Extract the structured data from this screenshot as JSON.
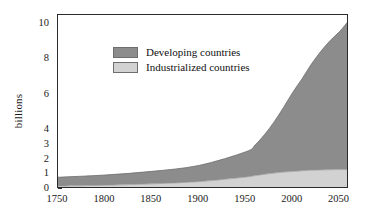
{
  "chart_data": {
    "type": "area",
    "stacked": true,
    "title": "",
    "xlabel": "",
    "ylabel": "billions",
    "xlim": [
      1750,
      2060
    ],
    "ylim": [
      0,
      10.5
    ],
    "grid": false,
    "legend_position": "inside-upper-left",
    "xticks": [
      1750,
      1800,
      1850,
      1900,
      1950,
      2000,
      2050
    ],
    "xtick_labels": [
      "1750",
      "1800",
      "1850",
      "1900",
      "1950",
      "2000",
      "2050"
    ],
    "yticks": [
      0,
      1,
      2,
      3,
      4,
      6,
      8,
      10
    ],
    "ytick_labels": [
      "0",
      "1",
      "2",
      "3",
      "4",
      "6",
      "8",
      "10"
    ],
    "x": [
      1750,
      1800,
      1850,
      1900,
      1950,
      1960,
      1970,
      1980,
      1990,
      2000,
      2010,
      2020,
      2030,
      2040,
      2050,
      2060
    ],
    "series": [
      {
        "name": "Industrialized countries",
        "color": "#d2d2d2",
        "values": [
          0.2,
          0.25,
          0.35,
          0.5,
          0.81,
          0.91,
          1.0,
          1.08,
          1.15,
          1.19,
          1.24,
          1.28,
          1.3,
          1.31,
          1.32,
          1.32
        ]
      },
      {
        "name": "Developing countries",
        "color": "#8c8c8c",
        "values": [
          0.6,
          0.7,
          0.85,
          1.1,
          1.72,
          2.09,
          2.7,
          3.37,
          4.11,
          4.94,
          5.66,
          6.45,
          7.15,
          7.75,
          8.25,
          8.88
        ]
      }
    ],
    "totals": [
      0.8,
      0.95,
      1.2,
      1.6,
      2.53,
      3.0,
      3.7,
      4.45,
      5.26,
      6.13,
      6.9,
      7.73,
      8.45,
      9.06,
      9.57,
      10.2
    ]
  },
  "legend": {
    "items": [
      {
        "label": "Developing countries",
        "color": "#8c8c8c"
      },
      {
        "label": "Industrialized countries",
        "color": "#d2d2d2"
      }
    ]
  },
  "axes": {
    "y_title": "billions"
  },
  "colors": {
    "developing": "#8c8c8c",
    "industrialized": "#d2d2d2",
    "frame": "#2b2b2b",
    "text": "#1a1a1a",
    "background": "#ffffff"
  }
}
